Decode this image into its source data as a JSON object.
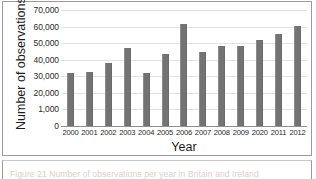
{
  "figure": {
    "caption": "Figure 21 Number of observations per year in Britain and Ireland"
  },
  "chart_data": {
    "type": "bar",
    "title": "",
    "xlabel": "Year",
    "ylabel": "Number of observations",
    "categories": [
      "2000",
      "2001",
      "2002",
      "2003",
      "2004",
      "2005",
      "2006",
      "2007",
      "2008",
      "2009",
      "2020",
      "2011",
      "2012"
    ],
    "values": [
      32000,
      32300,
      37800,
      46800,
      32200,
      43700,
      61700,
      44400,
      48200,
      48000,
      52200,
      55800,
      60300
    ],
    "series": [
      {
        "name": "Number of observations",
        "values": [
          32000,
          32300,
          37800,
          46800,
          32200,
          43700,
          61700,
          44400,
          48200,
          48000,
          52200,
          55800,
          60300
        ]
      }
    ],
    "ylim": [
      0,
      70000
    ],
    "ytick_values": [
      0,
      10000,
      20000,
      30000,
      40000,
      50000,
      60000,
      70000
    ],
    "ytick_labels": [
      "0",
      "1,000",
      "20,000",
      "30,000",
      "40,000",
      "50,000",
      "60,000",
      "70,000"
    ],
    "grid": true,
    "legend": "none",
    "bar_color": "#737373",
    "axis_color": "#8f8f8f",
    "gridline_color": "#e2e2e2"
  }
}
